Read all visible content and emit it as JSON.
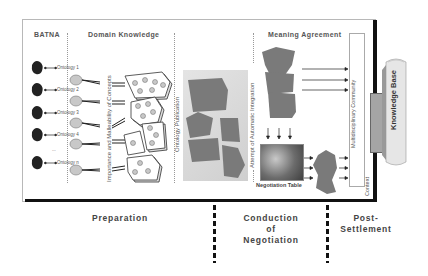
{
  "diagram": {
    "sections": {
      "batna": "BATNA",
      "domain_knowledge": "Domain Knowledge",
      "meaning_agreement": "Meaning Agreement"
    },
    "ontologies": [
      {
        "label": "Ontology 1"
      },
      {
        "label": "Ontology 2"
      },
      {
        "label": "Ontology 3"
      },
      {
        "label": "Ontology 4"
      },
      {
        "label": "..."
      },
      {
        "label": "Ontology n"
      }
    ],
    "vertical_labels": {
      "importance": "Importance and Malleability of Concepts",
      "publication": "Ontology Publication",
      "integration": "Attempt of Automatic Integration",
      "community": "Multidisciplinary Community",
      "context": "Context",
      "knowledge_base": "Knowledge Base"
    },
    "negotiation_table": "Negotiation Table",
    "phases": {
      "preparation": "Preparation",
      "conduction_line1": "Conduction",
      "conduction_line2": "of",
      "conduction_line3": "Negotiation",
      "post_line1": "Post-",
      "post_line2": "Settlement"
    },
    "colors": {
      "shape_fill": "#7a7a7a",
      "frame_border": "#111111",
      "node_fill": "#c8c8c8",
      "panel_bg": "#d9d9d9"
    }
  }
}
